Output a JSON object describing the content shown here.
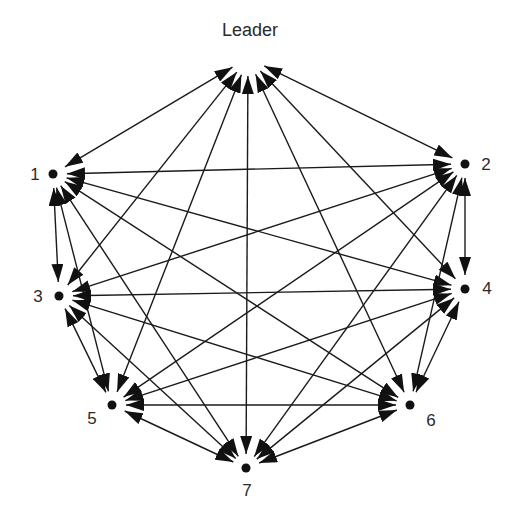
{
  "diagram": {
    "type": "complete-graph",
    "edge_style": "bidirectional-arrow",
    "colors": {
      "line": "#1a1a1a",
      "text": "#2a2a2a",
      "background": "#ffffff"
    },
    "nodes": [
      {
        "id": "L",
        "label": "Leader",
        "x": 248,
        "y": 58,
        "lx": 250,
        "ly": 36,
        "anchor": "middle",
        "dot": false
      },
      {
        "id": "1",
        "label": "1",
        "x": 53,
        "y": 174,
        "lx": 35,
        "ly": 180,
        "anchor": "middle",
        "dot": true
      },
      {
        "id": "2",
        "label": "2",
        "x": 465,
        "y": 164,
        "lx": 486,
        "ly": 170,
        "anchor": "middle",
        "dot": true
      },
      {
        "id": "3",
        "label": "3",
        "x": 59,
        "y": 296,
        "lx": 38,
        "ly": 302,
        "anchor": "middle",
        "dot": true
      },
      {
        "id": "4",
        "label": "4",
        "x": 465,
        "y": 289,
        "lx": 487,
        "ly": 294,
        "anchor": "middle",
        "dot": true
      },
      {
        "id": "5",
        "label": "5",
        "x": 112,
        "y": 405,
        "lx": 92,
        "ly": 424,
        "anchor": "middle",
        "dot": true
      },
      {
        "id": "6",
        "label": "6",
        "x": 410,
        "y": 405,
        "lx": 431,
        "ly": 426,
        "anchor": "middle",
        "dot": true
      },
      {
        "id": "7",
        "label": "7",
        "x": 246,
        "y": 468,
        "lx": 247,
        "ly": 496,
        "anchor": "middle",
        "dot": true
      }
    ],
    "edges": [
      [
        "L",
        "1"
      ],
      [
        "L",
        "2"
      ],
      [
        "L",
        "3"
      ],
      [
        "L",
        "4"
      ],
      [
        "L",
        "5"
      ],
      [
        "L",
        "6"
      ],
      [
        "L",
        "7"
      ],
      [
        "1",
        "2"
      ],
      [
        "1",
        "3"
      ],
      [
        "1",
        "4"
      ],
      [
        "1",
        "5"
      ],
      [
        "1",
        "6"
      ],
      [
        "1",
        "7"
      ],
      [
        "2",
        "3"
      ],
      [
        "2",
        "4"
      ],
      [
        "2",
        "5"
      ],
      [
        "2",
        "6"
      ],
      [
        "2",
        "7"
      ],
      [
        "3",
        "4"
      ],
      [
        "3",
        "5"
      ],
      [
        "3",
        "6"
      ],
      [
        "3",
        "7"
      ],
      [
        "4",
        "5"
      ],
      [
        "4",
        "6"
      ],
      [
        "4",
        "7"
      ],
      [
        "5",
        "6"
      ],
      [
        "5",
        "7"
      ],
      [
        "6",
        "7"
      ]
    ]
  }
}
